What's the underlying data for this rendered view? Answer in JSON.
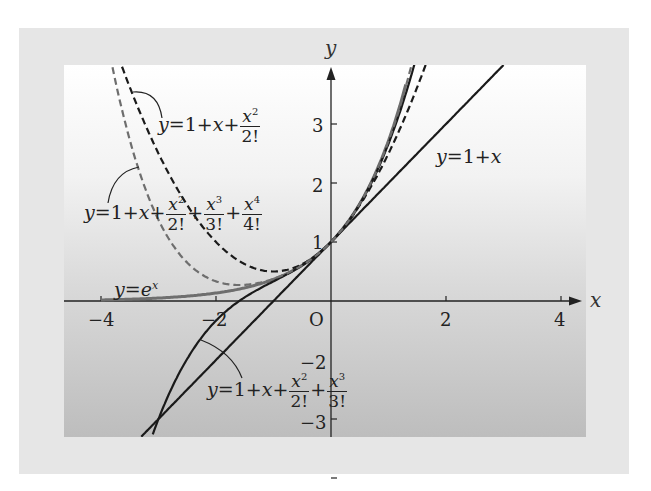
{
  "chart_data": {
    "type": "line",
    "title": "",
    "xlabel": "x",
    "ylabel": "y",
    "xlim": [
      -4.6,
      4.4
    ],
    "ylim": [
      -3.3,
      4.0
    ],
    "grid": false,
    "x_ticks": [
      -4,
      -2,
      2,
      4
    ],
    "x_tick_labels": [
      "−4",
      "−2",
      "2",
      "4"
    ],
    "y_ticks": [
      -3,
      -2,
      1,
      2,
      3
    ],
    "y_tick_labels": [
      "−3",
      "−2",
      "1",
      "2",
      "3"
    ],
    "origin_label": "O",
    "series": [
      {
        "name": "y=e^x",
        "label_parts": [
          "y=e",
          "x"
        ],
        "style": "solid",
        "color": "#6e6e6e",
        "order": "exp",
        "x": [
          -4,
          -3,
          -2,
          -1,
          0,
          0.5,
          1,
          1.3
        ],
        "y": [
          0.018,
          0.05,
          0.135,
          0.368,
          1,
          1.649,
          2.718,
          3.669
        ]
      },
      {
        "name": "y=1+x",
        "style": "solid",
        "color": "#1a1a1a",
        "order": 1,
        "x": [
          -3.3,
          -2,
          0,
          2,
          3
        ],
        "y": [
          -2.3,
          -1,
          1,
          3,
          4
        ]
      },
      {
        "name": "y=1+x+x^2/2!",
        "style": "dashed",
        "color": "#1a1a1a",
        "order": 2,
        "x": [
          -3.7,
          -3,
          -2,
          -1,
          0,
          1,
          1.65
        ],
        "y": [
          4.15,
          2.5,
          1,
          0.5,
          1,
          2.5,
          4.01
        ]
      },
      {
        "name": "y=1+x+x^2/2!+x^3/3!",
        "style": "solid",
        "color": "#1a1a1a",
        "order": 3,
        "x": [
          -3.1,
          -2,
          -1,
          0,
          1,
          1.5
        ],
        "y": [
          -3.26,
          -0.333,
          0.333,
          1,
          2.667,
          4.19
        ]
      },
      {
        "name": "y=1+x+x^2/2!+x^3/3!+x^4/4!",
        "style": "dashed",
        "color": "#6e6e6e",
        "order": 4,
        "x": [
          -3.8,
          -3,
          -2,
          -1,
          0,
          1,
          1.45
        ],
        "y": [
          4.8,
          1.375,
          0.333,
          0.375,
          1,
          2.708,
          4.09
        ]
      }
    ],
    "annotations": [
      {
        "text": "y=1+x+x²/2!",
        "position": "upper-left"
      },
      {
        "text": "y=1+x+x²/2!+x³/3!+x⁴/4!",
        "position": "left-middle"
      },
      {
        "text": "y=eˣ",
        "position": "left near x-axis"
      },
      {
        "text": "y=1+x",
        "position": "upper-right"
      },
      {
        "text": "y=1+x+x²/2!+x³/3!",
        "position": "lower-middle"
      }
    ]
  },
  "labels": {
    "l2": {
      "pre": "1+",
      "x": "x",
      "plus": "+",
      "num_var": "x",
      "num_pow": "2",
      "den": "2!"
    },
    "l4": {
      "pre": "1+",
      "x": "x",
      "plus": "+",
      "n2v": "x",
      "n2p": "2",
      "d2": "2!",
      "n3v": "x",
      "n3p": "3",
      "d3": "3!",
      "n4v": "x",
      "n4p": "4",
      "d4": "4!"
    },
    "l3": {
      "pre": "1+",
      "x": "x",
      "plus": "+",
      "n2v": "x",
      "n2p": "2",
      "d2": "2!",
      "n3v": "x",
      "n3p": "3",
      "d3": "3!"
    },
    "lexp": {
      "y": "y",
      "eq": "=",
      "base": "e",
      "pow": "x"
    },
    "l1": {
      "y": "y",
      "eq": "=1+",
      "x": "x"
    },
    "y_eq": "y",
    "eq": "="
  }
}
